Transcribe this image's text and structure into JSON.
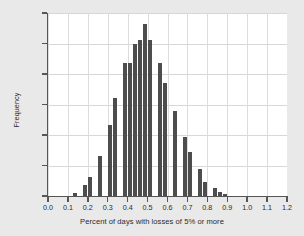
{
  "chart_data": {
    "type": "bar",
    "title": "",
    "xlabel": "Percent of days with losses of 5% or more",
    "ylabel": "Frequency",
    "xlim": [
      0.0,
      1.2
    ],
    "ylim": [
      0,
      1200
    ],
    "grid": true,
    "legend": false,
    "bin_width": 0.025,
    "bar_color": "#4d4d4d",
    "plot_background": "#ffffff",
    "figure_background": "#e9e9e9",
    "xticks": [
      "0.0",
      "0.1",
      "0.2",
      "0.3",
      "0.4",
      "0.5",
      "0.6",
      "0.7",
      "0.8",
      "0.9",
      "1.0",
      "1.1",
      "1.2"
    ],
    "xtick_values": [
      0.0,
      0.1,
      0.2,
      0.3,
      0.4,
      0.5,
      0.6,
      0.7,
      0.8,
      0.9,
      1.0,
      1.1,
      1.2
    ],
    "yticks": [
      "0",
      "200",
      "400",
      "600",
      "800",
      "1000",
      "1200"
    ],
    "ytick_values": [
      0,
      200,
      400,
      600,
      800,
      1000,
      1200
    ],
    "bin_centers": [
      0.1375,
      0.1625,
      0.1875,
      0.2125,
      0.2375,
      0.2625,
      0.2875,
      0.3125,
      0.3375,
      0.3625,
      0.3875,
      0.4125,
      0.4375,
      0.4625,
      0.4875,
      0.5125,
      0.5375,
      0.5625,
      0.5875,
      0.6125,
      0.6375,
      0.6625,
      0.6875,
      0.7125,
      0.7375,
      0.7625,
      0.7875,
      0.8125,
      0.8375,
      0.8625,
      0.8875,
      0.9125,
      0.9375
    ],
    "categories": [
      "0.1375",
      "0.1625",
      "0.1875",
      "0.2125",
      "0.2375",
      "0.2625",
      "0.2875",
      "0.3125",
      "0.3375",
      "0.3625",
      "0.3875",
      "0.4125",
      "0.4375",
      "0.4625",
      "0.4875",
      "0.5125",
      "0.5375",
      "0.5625",
      "0.5875",
      "0.6125",
      "0.6375",
      "0.6625",
      "0.6875",
      "0.7125",
      "0.7375",
      "0.7625",
      "0.7875",
      "0.8125",
      "0.8375",
      "0.8625",
      "0.8875",
      "0.9125",
      "0.9375"
    ],
    "values": [
      20,
      0,
      70,
      125,
      0,
      260,
      0,
      465,
      640,
      0,
      870,
      870,
      1000,
      1025,
      1130,
      1025,
      0,
      875,
      740,
      0,
      560,
      0,
      385,
      290,
      0,
      180,
      90,
      0,
      50,
      28,
      10,
      0,
      0
    ]
  }
}
